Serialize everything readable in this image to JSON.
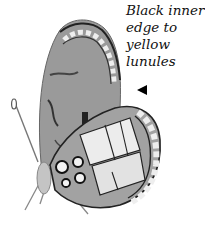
{
  "annotation": {
    "lines": [
      "Black inner",
      "edge to",
      "yellow",
      "lunules"
    ],
    "pointer": "left-pointing-triangle"
  },
  "illustration": {
    "subject": "butterfly (side view, wings closed)",
    "palette": {
      "wing_base": "#8f8f8f",
      "wing_light": "#e6e6e6",
      "vein": "#1a1a1a",
      "body": "#bdbdbd"
    }
  }
}
